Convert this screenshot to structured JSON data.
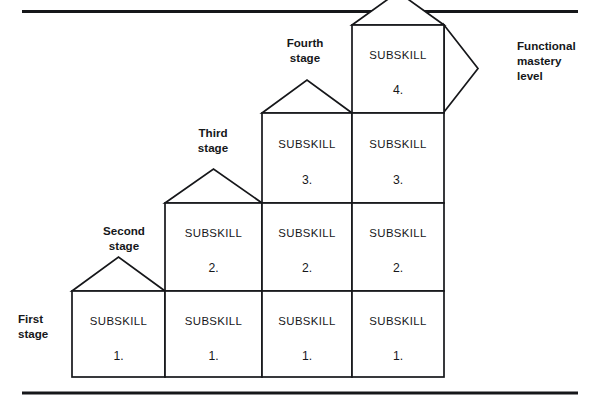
{
  "figure": {
    "type": "staircase-block-diagram",
    "background_color": "#ffffff",
    "line_color": "#16171a",
    "columns": [
      {
        "id": "column-1",
        "stage_label_line1": "First",
        "stage_label_line2": "stage",
        "cells": [
          {
            "title": "SUBSKILL",
            "number": "1."
          }
        ]
      },
      {
        "id": "column-2",
        "stage_label_line1": "Second",
        "stage_label_line2": "stage",
        "cells": [
          {
            "title": "SUBSKILL",
            "number": "1."
          },
          {
            "title": "SUBSKILL",
            "number": "2."
          }
        ]
      },
      {
        "id": "column-3",
        "stage_label_line1": "Third",
        "stage_label_line2": "stage",
        "cells": [
          {
            "title": "SUBSKILL",
            "number": "1."
          },
          {
            "title": "SUBSKILL",
            "number": "2."
          },
          {
            "title": "SUBSKILL",
            "number": "3."
          }
        ]
      },
      {
        "id": "column-4",
        "stage_label_line1": "Fourth",
        "stage_label_line2": "stage",
        "cells": [
          {
            "title": "SUBSKILL",
            "number": "1."
          },
          {
            "title": "SUBSKILL",
            "number": "2."
          },
          {
            "title": "SUBSKILL",
            "number": "3."
          },
          {
            "title": "SUBSKILL",
            "number": "4."
          }
        ]
      }
    ],
    "outcome_label": {
      "line1": "Functional",
      "line2": "mastery",
      "line3": "level"
    }
  }
}
